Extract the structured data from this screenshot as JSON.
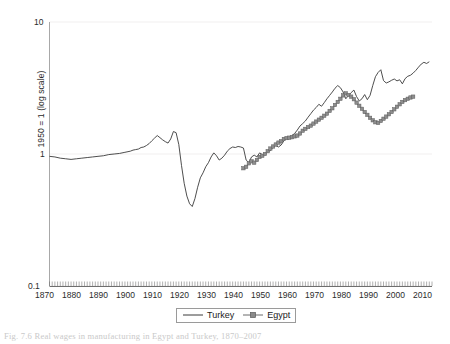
{
  "figure": {
    "caption": "Fig. 7.6  Real wages in manufacturing in Egypt and Turkey, 1870–2007",
    "ylabel": "1950 = 1 (log scale)"
  },
  "axes": {
    "y_ticks": [
      "10",
      "1",
      "0.1"
    ],
    "x_ticks": [
      "1870",
      "1880",
      "1890",
      "1900",
      "1910",
      "1920",
      "1930",
      "1940",
      "1950",
      "1960",
      "1970",
      "1980",
      "1990",
      "2000",
      "2010"
    ]
  },
  "legend": {
    "items": [
      {
        "label": "Turkey",
        "marker": "line",
        "color": "#3a3a3a"
      },
      {
        "label": "Egypt",
        "marker": "line-square",
        "color": "#6b6b6b"
      }
    ]
  },
  "chart_data": {
    "type": "line",
    "title": "",
    "subtitle": "",
    "xlabel": "",
    "ylabel": "1950 = 1 (log scale)",
    "yscale": "log",
    "ylim": [
      0.1,
      10
    ],
    "xlim": [
      1870,
      2012
    ],
    "grid": "horizontal-faint",
    "legend_position": "bottom-center",
    "y_tick_values": [
      0.1,
      1,
      10
    ],
    "x_tick_values": [
      1870,
      1880,
      1890,
      1900,
      1910,
      1920,
      1930,
      1940,
      1950,
      1960,
      1970,
      1980,
      1990,
      2000,
      2010
    ],
    "series": [
      {
        "name": "Turkey",
        "marker": "none",
        "color": "#3a3a3a",
        "points": [
          [
            1870,
            0.96
          ],
          [
            1872,
            0.95
          ],
          [
            1874,
            0.93
          ],
          [
            1876,
            0.92
          ],
          [
            1878,
            0.91
          ],
          [
            1880,
            0.92
          ],
          [
            1882,
            0.93
          ],
          [
            1884,
            0.94
          ],
          [
            1886,
            0.95
          ],
          [
            1888,
            0.96
          ],
          [
            1890,
            0.97
          ],
          [
            1892,
            0.99
          ],
          [
            1894,
            1.0
          ],
          [
            1896,
            1.01
          ],
          [
            1898,
            1.03
          ],
          [
            1900,
            1.05
          ],
          [
            1901,
            1.07
          ],
          [
            1902,
            1.08
          ],
          [
            1903,
            1.09
          ],
          [
            1904,
            1.12
          ],
          [
            1905,
            1.13
          ],
          [
            1906,
            1.16
          ],
          [
            1907,
            1.2
          ],
          [
            1908,
            1.26
          ],
          [
            1909,
            1.32
          ],
          [
            1910,
            1.38
          ],
          [
            1911,
            1.33
          ],
          [
            1912,
            1.28
          ],
          [
            1913,
            1.24
          ],
          [
            1914,
            1.21
          ],
          [
            1915,
            1.3
          ],
          [
            1916,
            1.48
          ],
          [
            1917,
            1.45
          ],
          [
            1918,
            1.18
          ],
          [
            1919,
            0.82
          ],
          [
            1920,
            0.6
          ],
          [
            1921,
            0.48
          ],
          [
            1922,
            0.42
          ],
          [
            1923,
            0.4
          ],
          [
            1924,
            0.46
          ],
          [
            1925,
            0.56
          ],
          [
            1926,
            0.66
          ],
          [
            1927,
            0.72
          ],
          [
            1928,
            0.8
          ],
          [
            1929,
            0.86
          ],
          [
            1930,
            0.95
          ],
          [
            1931,
            1.02
          ],
          [
            1932,
            0.97
          ],
          [
            1933,
            0.9
          ],
          [
            1934,
            0.93
          ],
          [
            1935,
            0.98
          ],
          [
            1936,
            1.05
          ],
          [
            1937,
            1.1
          ],
          [
            1938,
            1.13
          ],
          [
            1939,
            1.12
          ],
          [
            1940,
            1.14
          ],
          [
            1941,
            1.13
          ],
          [
            1942,
            1.11
          ],
          [
            1943,
            0.9
          ],
          [
            1944,
            0.86
          ],
          [
            1945,
            0.95
          ],
          [
            1946,
            0.98
          ],
          [
            1947,
            0.95
          ],
          [
            1948,
            1.02
          ],
          [
            1949,
            0.99
          ],
          [
            1950,
            1.0
          ],
          [
            1951,
            1.04
          ],
          [
            1952,
            1.06
          ],
          [
            1953,
            1.13
          ],
          [
            1954,
            1.16
          ],
          [
            1955,
            1.13
          ],
          [
            1956,
            1.17
          ],
          [
            1957,
            1.26
          ],
          [
            1958,
            1.32
          ],
          [
            1959,
            1.3
          ],
          [
            1960,
            1.38
          ],
          [
            1961,
            1.43
          ],
          [
            1962,
            1.52
          ],
          [
            1963,
            1.63
          ],
          [
            1964,
            1.7
          ],
          [
            1965,
            1.78
          ],
          [
            1966,
            1.9
          ],
          [
            1967,
            2.02
          ],
          [
            1968,
            2.15
          ],
          [
            1969,
            2.25
          ],
          [
            1970,
            2.38
          ],
          [
            1971,
            2.3
          ],
          [
            1972,
            2.45
          ],
          [
            1973,
            2.62
          ],
          [
            1974,
            2.78
          ],
          [
            1975,
            2.95
          ],
          [
            1976,
            3.15
          ],
          [
            1977,
            3.3
          ],
          [
            1978,
            3.18
          ],
          [
            1979,
            2.95
          ],
          [
            1980,
            2.62
          ],
          [
            1981,
            2.78
          ],
          [
            1982,
            2.92
          ],
          [
            1983,
            3.05
          ],
          [
            1984,
            2.72
          ],
          [
            1985,
            2.52
          ],
          [
            1986,
            2.62
          ],
          [
            1987,
            2.82
          ],
          [
            1988,
            2.58
          ],
          [
            1989,
            2.78
          ],
          [
            1990,
            3.3
          ],
          [
            1991,
            3.85
          ],
          [
            1992,
            4.15
          ],
          [
            1993,
            4.35
          ],
          [
            1994,
            3.6
          ],
          [
            1995,
            3.45
          ],
          [
            1996,
            3.52
          ],
          [
            1997,
            3.62
          ],
          [
            1998,
            3.7
          ],
          [
            1999,
            3.58
          ],
          [
            2000,
            3.65
          ],
          [
            2001,
            3.4
          ],
          [
            2002,
            3.72
          ],
          [
            2003,
            3.88
          ],
          [
            2004,
            3.95
          ],
          [
            2005,
            4.1
          ],
          [
            2006,
            4.3
          ],
          [
            2007,
            4.55
          ],
          [
            2008,
            4.8
          ],
          [
            2009,
            4.95
          ],
          [
            2010,
            4.85
          ],
          [
            2011,
            5.0
          ]
        ]
      },
      {
        "name": "Egypt",
        "marker": "square",
        "color": "#6b6b6b",
        "points": [
          [
            1942,
            0.78
          ],
          [
            1943,
            0.8
          ],
          [
            1944,
            0.85
          ],
          [
            1945,
            0.88
          ],
          [
            1946,
            0.86
          ],
          [
            1947,
            0.9
          ],
          [
            1948,
            0.95
          ],
          [
            1949,
            0.97
          ],
          [
            1950,
            1.0
          ],
          [
            1951,
            1.05
          ],
          [
            1952,
            1.1
          ],
          [
            1953,
            1.14
          ],
          [
            1954,
            1.18
          ],
          [
            1955,
            1.22
          ],
          [
            1956,
            1.25
          ],
          [
            1957,
            1.3
          ],
          [
            1958,
            1.32
          ],
          [
            1959,
            1.33
          ],
          [
            1960,
            1.34
          ],
          [
            1961,
            1.36
          ],
          [
            1962,
            1.38
          ],
          [
            1963,
            1.43
          ],
          [
            1964,
            1.5
          ],
          [
            1965,
            1.55
          ],
          [
            1966,
            1.6
          ],
          [
            1967,
            1.64
          ],
          [
            1968,
            1.7
          ],
          [
            1969,
            1.76
          ],
          [
            1970,
            1.82
          ],
          [
            1971,
            1.88
          ],
          [
            1972,
            1.95
          ],
          [
            1973,
            2.02
          ],
          [
            1974,
            2.12
          ],
          [
            1975,
            2.22
          ],
          [
            1976,
            2.35
          ],
          [
            1977,
            2.48
          ],
          [
            1978,
            2.62
          ],
          [
            1979,
            2.78
          ],
          [
            1980,
            2.88
          ],
          [
            1981,
            2.8
          ],
          [
            1982,
            2.72
          ],
          [
            1983,
            2.6
          ],
          [
            1984,
            2.45
          ],
          [
            1985,
            2.32
          ],
          [
            1986,
            2.2
          ],
          [
            1987,
            2.08
          ],
          [
            1988,
            1.98
          ],
          [
            1989,
            1.88
          ],
          [
            1990,
            1.8
          ],
          [
            1991,
            1.74
          ],
          [
            1992,
            1.72
          ],
          [
            1993,
            1.78
          ],
          [
            1994,
            1.85
          ],
          [
            1995,
            1.92
          ],
          [
            1996,
            2.0
          ],
          [
            1997,
            2.08
          ],
          [
            1998,
            2.18
          ],
          [
            1999,
            2.28
          ],
          [
            2000,
            2.38
          ],
          [
            2001,
            2.48
          ],
          [
            2002,
            2.56
          ],
          [
            2003,
            2.62
          ],
          [
            2004,
            2.68
          ],
          [
            2005,
            2.72
          ]
        ]
      }
    ]
  }
}
